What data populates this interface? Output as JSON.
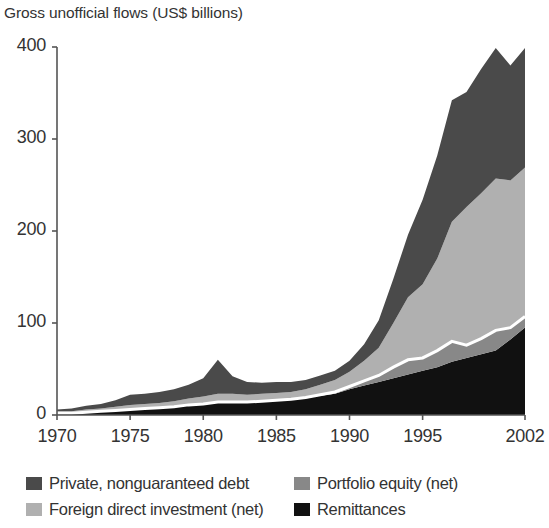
{
  "chart_data": {
    "type": "area",
    "title": "Gross unofficial flows (US$ billions)",
    "xlabel": "",
    "ylabel": "",
    "stacked": true,
    "grid": false,
    "legend_position": "bottom",
    "xlim": [
      1970,
      2002
    ],
    "ylim": [
      0,
      400
    ],
    "yticks": [
      0,
      100,
      200,
      300,
      400
    ],
    "xticks": [
      1970,
      1975,
      1980,
      1985,
      1990,
      1995,
      2002
    ],
    "x": [
      1970,
      1971,
      1972,
      1973,
      1974,
      1975,
      1976,
      1977,
      1978,
      1979,
      1980,
      1981,
      1982,
      1983,
      1984,
      1985,
      1986,
      1987,
      1988,
      1989,
      1990,
      1991,
      1992,
      1993,
      1994,
      1995,
      1996,
      1997,
      1998,
      1999,
      2000,
      2001,
      2002
    ],
    "series": [
      {
        "name": "Remittances",
        "color": "#111111",
        "values": [
          2,
          2,
          3,
          4,
          5,
          6,
          7,
          8,
          9,
          11,
          12,
          14,
          14,
          14,
          15,
          16,
          17,
          19,
          21,
          23,
          28,
          32,
          36,
          40,
          44,
          48,
          52,
          58,
          62,
          66,
          70,
          82,
          95
        ]
      },
      {
        "name": "Portfolio equity (net)",
        "color": "#888888",
        "values": [
          0,
          0,
          0,
          0,
          0,
          0,
          0,
          0,
          0,
          0,
          0,
          0,
          0,
          0,
          0,
          0,
          0,
          0,
          1,
          2,
          3,
          5,
          7,
          12,
          16,
          14,
          18,
          22,
          14,
          17,
          22,
          13,
          12
        ]
      },
      {
        "name": "Foreign direct investment (net)",
        "color": "#b0b0b0",
        "values": [
          2,
          2,
          3,
          3,
          4,
          5,
          5,
          5,
          6,
          7,
          8,
          9,
          9,
          8,
          8,
          8,
          8,
          9,
          11,
          13,
          16,
          22,
          30,
          48,
          68,
          80,
          100,
          130,
          150,
          158,
          165,
          160,
          162
        ]
      },
      {
        "name": "Private, nonguaranteed debt",
        "color": "#4a4a4a",
        "values": [
          2,
          3,
          4,
          5,
          7,
          11,
          11,
          12,
          13,
          15,
          20,
          37,
          19,
          14,
          12,
          12,
          11,
          10,
          10,
          10,
          12,
          18,
          30,
          48,
          68,
          92,
          112,
          132,
          125,
          135,
          142,
          125,
          130
        ]
      }
    ],
    "series_order_bottom_to_top": [
      "Remittances",
      "Portfolio equity (net)",
      "Foreign direct investment (net)",
      "Private, nonguaranteed debt"
    ],
    "annotations": []
  },
  "axis": {
    "y_tick_labels": [
      "400",
      "300",
      "200",
      "100",
      "0"
    ],
    "x_tick_labels": [
      "1970",
      "1975",
      "1980",
      "1985",
      "1990",
      "1995",
      "2002"
    ]
  },
  "legend": {
    "items": [
      {
        "label": "Private, nonguaranteed debt",
        "color": "#4a4a4a"
      },
      {
        "label": "Portfolio equity (net)",
        "color": "#888888"
      },
      {
        "label": "Foreign direct investment (net)",
        "color": "#b0b0b0"
      },
      {
        "label": "Remittances",
        "color": "#111111"
      }
    ]
  },
  "colors": {
    "axis": "#555555",
    "text": "#333333",
    "background": "#ffffff",
    "separator": "#ffffff"
  }
}
